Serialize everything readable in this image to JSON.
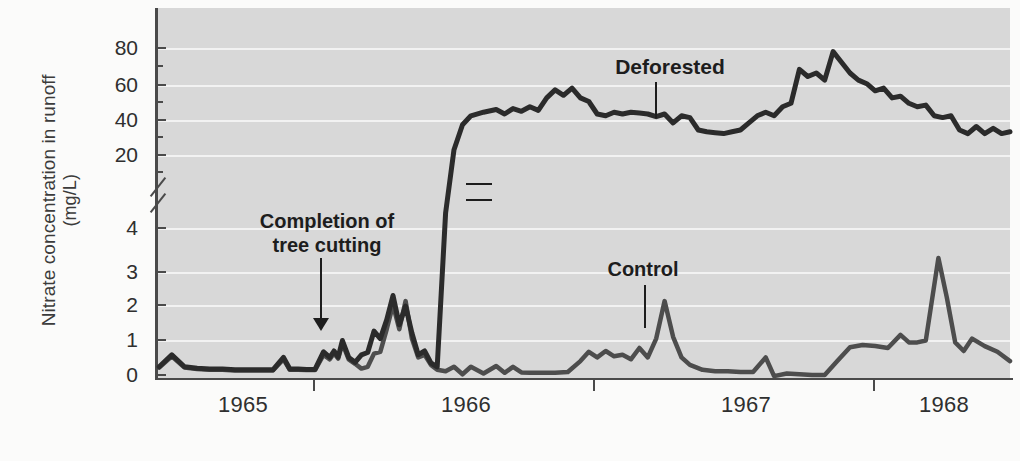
{
  "chart_data": {
    "type": "line",
    "title": "",
    "xlabel": "",
    "ylabel_line1": "Nitrate concentration in runoff",
    "ylabel_line2": "(mg/L)",
    "grid": true,
    "legend_position": "inline-annotations",
    "broken_axis": true,
    "x_tick_labels": [
      "1965",
      "1966",
      "1967",
      "1968"
    ],
    "x_tick_positions_year": [
      1965.0,
      1966.0,
      1967.0,
      1968.0
    ],
    "xlim": [
      1964.44,
      1968.5
    ],
    "lower_panel": {
      "ylim": [
        0,
        4.6
      ],
      "y_tick_labels": [
        "0",
        "1",
        "2",
        "3",
        "4"
      ],
      "y_tick_values": [
        0,
        1,
        2,
        3,
        4
      ]
    },
    "upper_panel": {
      "ylim": [
        14,
        90
      ],
      "y_tick_labels": [
        "20",
        "40",
        "60",
        "80"
      ],
      "y_tick_values": [
        20,
        40,
        60,
        80
      ]
    },
    "annotations": [
      {
        "text_line1": "Completion of",
        "text_line2": "tree cutting",
        "points_to_year": 1965.33,
        "points_to_value": 1.0
      },
      {
        "text": "Deforested",
        "points_to_year": 1966.52,
        "points_to_value": 42
      },
      {
        "text": "Control",
        "points_to_year": 1966.75,
        "points_to_value": 1.25
      }
    ],
    "series": [
      {
        "name": "Deforested",
        "color": "#2b2b2b",
        "points": [
          [
            1964.46,
            0.3
          ],
          [
            1964.52,
            0.62
          ],
          [
            1964.58,
            0.3
          ],
          [
            1964.64,
            0.26
          ],
          [
            1964.7,
            0.24
          ],
          [
            1964.76,
            0.24
          ],
          [
            1964.82,
            0.22
          ],
          [
            1964.88,
            0.22
          ],
          [
            1964.94,
            0.22
          ],
          [
            1965.0,
            0.22
          ],
          [
            1965.05,
            0.55
          ],
          [
            1965.08,
            0.24
          ],
          [
            1965.12,
            0.24
          ],
          [
            1965.16,
            0.23
          ],
          [
            1965.2,
            0.23
          ],
          [
            1965.24,
            0.7
          ],
          [
            1965.27,
            0.55
          ],
          [
            1965.29,
            0.72
          ],
          [
            1965.31,
            0.56
          ],
          [
            1965.33,
            1.0
          ],
          [
            1965.36,
            0.55
          ],
          [
            1965.39,
            0.42
          ],
          [
            1965.42,
            0.62
          ],
          [
            1965.45,
            0.68
          ],
          [
            1965.48,
            1.25
          ],
          [
            1965.51,
            1.05
          ],
          [
            1965.54,
            1.55
          ],
          [
            1965.57,
            2.2
          ],
          [
            1965.6,
            1.42
          ],
          [
            1965.63,
            1.92
          ],
          [
            1965.66,
            1.2
          ],
          [
            1965.69,
            0.62
          ],
          [
            1965.72,
            0.72
          ],
          [
            1965.75,
            0.4
          ],
          [
            1965.78,
            0.3
          ],
          [
            1965.82,
            4.4
          ],
          [
            1965.86,
            23.0
          ],
          [
            1965.9,
            37.0
          ],
          [
            1965.94,
            42.0
          ],
          [
            1966.0,
            44.0
          ],
          [
            1966.06,
            45.5
          ],
          [
            1966.1,
            43.0
          ],
          [
            1966.14,
            46.0
          ],
          [
            1966.18,
            44.5
          ],
          [
            1966.22,
            47.0
          ],
          [
            1966.26,
            45.0
          ],
          [
            1966.3,
            52.0
          ],
          [
            1966.34,
            56.5
          ],
          [
            1966.38,
            53.5
          ],
          [
            1966.42,
            57.5
          ],
          [
            1966.46,
            52.0
          ],
          [
            1966.5,
            50.0
          ],
          [
            1966.54,
            43.0
          ],
          [
            1966.58,
            42.0
          ],
          [
            1966.62,
            44.0
          ],
          [
            1966.66,
            43.0
          ],
          [
            1966.7,
            44.0
          ],
          [
            1966.74,
            43.5
          ],
          [
            1966.78,
            43.0
          ],
          [
            1966.82,
            41.5
          ],
          [
            1966.86,
            43.0
          ],
          [
            1966.9,
            38.0
          ],
          [
            1966.94,
            42.0
          ],
          [
            1966.98,
            41.0
          ],
          [
            1967.02,
            34.0
          ],
          [
            1967.06,
            33.0
          ],
          [
            1967.1,
            32.5
          ],
          [
            1967.14,
            32.0
          ],
          [
            1967.18,
            33.0
          ],
          [
            1967.22,
            34.0
          ],
          [
            1967.26,
            38.0
          ],
          [
            1967.3,
            42.0
          ],
          [
            1967.34,
            44.0
          ],
          [
            1967.38,
            42.0
          ],
          [
            1967.42,
            47.0
          ],
          [
            1967.46,
            49.0
          ],
          [
            1967.5,
            68.0
          ],
          [
            1967.54,
            64.0
          ],
          [
            1967.58,
            66.0
          ],
          [
            1967.62,
            62.0
          ],
          [
            1967.66,
            78.0
          ],
          [
            1967.7,
            72.0
          ],
          [
            1967.74,
            66.0
          ],
          [
            1967.78,
            62.0
          ],
          [
            1967.82,
            60.0
          ],
          [
            1967.86,
            56.0
          ],
          [
            1967.9,
            57.5
          ],
          [
            1967.94,
            52.0
          ],
          [
            1967.98,
            53.0
          ],
          [
            1968.02,
            49.0
          ],
          [
            1968.06,
            47.0
          ],
          [
            1968.1,
            48.0
          ],
          [
            1968.14,
            42.0
          ],
          [
            1968.18,
            41.0
          ],
          [
            1968.22,
            42.0
          ],
          [
            1968.26,
            34.0
          ],
          [
            1968.3,
            32.0
          ],
          [
            1968.34,
            36.0
          ],
          [
            1968.38,
            32.0
          ],
          [
            1968.42,
            35.0
          ],
          [
            1968.46,
            32.0
          ],
          [
            1968.5,
            33.0
          ]
        ]
      },
      {
        "name": "Control",
        "color": "#4d4d4d",
        "points": [
          [
            1964.46,
            0.28
          ],
          [
            1964.52,
            0.58
          ],
          [
            1964.58,
            0.28
          ],
          [
            1964.64,
            0.24
          ],
          [
            1964.7,
            0.22
          ],
          [
            1964.76,
            0.22
          ],
          [
            1964.82,
            0.2
          ],
          [
            1964.88,
            0.2
          ],
          [
            1964.94,
            0.2
          ],
          [
            1965.0,
            0.2
          ],
          [
            1965.05,
            0.5
          ],
          [
            1965.08,
            0.22
          ],
          [
            1965.12,
            0.22
          ],
          [
            1965.16,
            0.21
          ],
          [
            1965.2,
            0.21
          ],
          [
            1965.24,
            0.62
          ],
          [
            1965.27,
            0.5
          ],
          [
            1965.29,
            0.66
          ],
          [
            1965.31,
            0.52
          ],
          [
            1965.33,
            0.92
          ],
          [
            1965.36,
            0.5
          ],
          [
            1965.39,
            0.38
          ],
          [
            1965.42,
            0.25
          ],
          [
            1965.45,
            0.3
          ],
          [
            1965.48,
            0.65
          ],
          [
            1965.51,
            0.7
          ],
          [
            1965.54,
            1.3
          ],
          [
            1965.57,
            1.95
          ],
          [
            1965.6,
            1.3
          ],
          [
            1965.63,
            2.05
          ],
          [
            1965.66,
            1.05
          ],
          [
            1965.69,
            0.55
          ],
          [
            1965.72,
            0.62
          ],
          [
            1965.75,
            0.35
          ],
          [
            1965.78,
            0.22
          ],
          [
            1965.82,
            0.18
          ],
          [
            1965.86,
            0.3
          ],
          [
            1965.9,
            0.1
          ],
          [
            1965.94,
            0.3
          ],
          [
            1966.0,
            0.12
          ],
          [
            1966.06,
            0.32
          ],
          [
            1966.1,
            0.14
          ],
          [
            1966.14,
            0.3
          ],
          [
            1966.18,
            0.15
          ],
          [
            1966.22,
            0.14
          ],
          [
            1966.28,
            0.14
          ],
          [
            1966.34,
            0.14
          ],
          [
            1966.4,
            0.16
          ],
          [
            1966.46,
            0.45
          ],
          [
            1966.5,
            0.7
          ],
          [
            1966.54,
            0.55
          ],
          [
            1966.58,
            0.72
          ],
          [
            1966.62,
            0.58
          ],
          [
            1966.66,
            0.62
          ],
          [
            1966.7,
            0.5
          ],
          [
            1966.74,
            0.8
          ],
          [
            1966.78,
            0.55
          ],
          [
            1966.82,
            1.05
          ],
          [
            1966.86,
            2.05
          ],
          [
            1966.9,
            1.1
          ],
          [
            1966.94,
            0.55
          ],
          [
            1966.98,
            0.35
          ],
          [
            1967.04,
            0.22
          ],
          [
            1967.1,
            0.18
          ],
          [
            1967.16,
            0.18
          ],
          [
            1967.22,
            0.16
          ],
          [
            1967.28,
            0.16
          ],
          [
            1967.34,
            0.55
          ],
          [
            1967.38,
            0.05
          ],
          [
            1967.44,
            0.12
          ],
          [
            1967.5,
            0.1
          ],
          [
            1967.56,
            0.08
          ],
          [
            1967.62,
            0.08
          ],
          [
            1967.68,
            0.45
          ],
          [
            1967.74,
            0.82
          ],
          [
            1967.8,
            0.88
          ],
          [
            1967.86,
            0.85
          ],
          [
            1967.92,
            0.8
          ],
          [
            1967.98,
            1.15
          ],
          [
            1968.02,
            0.95
          ],
          [
            1968.06,
            0.95
          ],
          [
            1968.1,
            1.0
          ],
          [
            1968.16,
            3.2
          ],
          [
            1968.2,
            2.15
          ],
          [
            1968.24,
            0.95
          ],
          [
            1968.28,
            0.72
          ],
          [
            1968.32,
            1.05
          ],
          [
            1968.38,
            0.85
          ],
          [
            1968.44,
            0.7
          ],
          [
            1968.5,
            0.45
          ]
        ]
      }
    ]
  },
  "axis": {
    "ylabel_line1": "Nitrate concentration in runoff",
    "ylabel_line2": "(mg/L)",
    "y_upper_ticks": [
      "80",
      "60",
      "40",
      "20"
    ],
    "y_lower_ticks": [
      "4",
      "3",
      "2",
      "1",
      "0"
    ],
    "x_ticks": [
      "1965",
      "1966",
      "1967",
      "1968"
    ]
  },
  "labels": {
    "cut_line1": "Completion of",
    "cut_line2": "tree cutting",
    "deforested": "Deforested",
    "control": "Control"
  },
  "colors": {
    "plot_background": "#d8d8d8",
    "page_background": "#fbfbfa",
    "gridline": "#f2f2f2",
    "axis": "#4a4a4a",
    "deforested_series": "#2b2b2b",
    "control_series": "#4d4d4d",
    "text": "#2f2f2f"
  }
}
